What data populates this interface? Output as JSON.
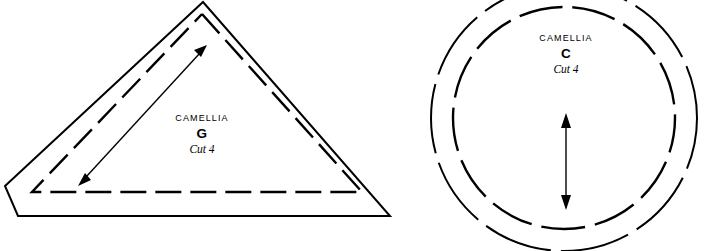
{
  "sheet": {
    "width": 706,
    "height": 251,
    "background": "#ffffff",
    "ink": "#000000",
    "description": "Two sewing pattern pieces drawn as line art"
  },
  "pieces": [
    {
      "id": "piece-g",
      "shape": "triangle",
      "brand_label": "CAMELLIA",
      "piece_letter": "G",
      "cut_instruction": "Cut 4",
      "label_center_x": 202,
      "cutting_line": {
        "style": "solid",
        "points": "203,2 390,216 18,216 5,186"
      },
      "stitching_line": {
        "style": "dashed",
        "points": "202,14 362,192 32,192 202,14",
        "dash": "26 9"
      },
      "grainline": {
        "style": "double-headed-arrow",
        "direction": "diagonal",
        "x1": 78,
        "y1": 186,
        "x2": 207,
        "y2": 45
      }
    },
    {
      "id": "piece-c",
      "shape": "circle",
      "brand_label": "CAMELLIA",
      "piece_letter": "C",
      "cut_instruction": "Cut 4",
      "label_center_x": 566,
      "center_x": 564,
      "center_y": 118,
      "cutting_line": {
        "style": "dashed",
        "radius": 133,
        "dash": "70 10"
      },
      "stitching_line": {
        "style": "dashed",
        "radius": 111,
        "dash": "44 10"
      },
      "grainline": {
        "style": "double-headed-arrow",
        "direction": "vertical",
        "x1": 566,
        "y1": 115,
        "x2": 566,
        "y2": 208
      }
    }
  ],
  "text_rows": {
    "piece_g": {
      "brand_y": 121,
      "letter_y": 138,
      "cut_y": 153
    },
    "piece_c": {
      "brand_y": 41,
      "letter_y": 58,
      "cut_y": 73
    }
  }
}
